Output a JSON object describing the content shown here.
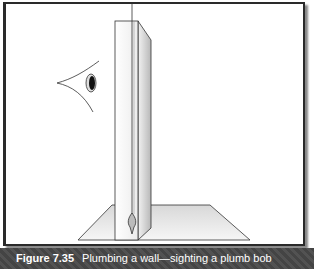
{
  "figure": {
    "number": "Figure 7.35",
    "title": "Plumbing a wall—sighting a plumb bob"
  },
  "diagram": {
    "elements": [
      "eye-icon",
      "wall",
      "plumb-line",
      "plumb-bob",
      "floor"
    ],
    "colors": {
      "line": "#222222",
      "shade": "#bdbdbd",
      "caption_bg": "#4a4a4a",
      "caption_text": "#ffffff"
    }
  }
}
